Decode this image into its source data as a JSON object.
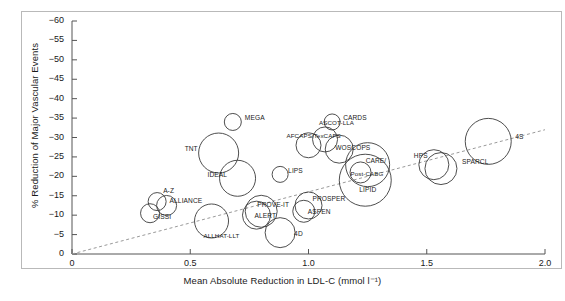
{
  "chart_data": {
    "type": "scatter",
    "title": "",
    "xlabel": "Mean Absolute Reduction in LDL-C (mmol l⁻¹)",
    "ylabel": "% Reduction of Major Vascular Events",
    "xlim": [
      0,
      2.0
    ],
    "ylim": [
      0,
      -60
    ],
    "xticks": [
      "0",
      "0.5",
      "1.0",
      "1.5",
      "2.0"
    ],
    "xtick_values": [
      0,
      0.5,
      1.0,
      1.5,
      2.0
    ],
    "yticks": [
      "0",
      "−5",
      "−10",
      "−15",
      "−20",
      "−25",
      "−30",
      "−35",
      "−40",
      "−45",
      "−50",
      "−55",
      "−60"
    ],
    "ytick_values": [
      0,
      -5,
      -10,
      -15,
      -20,
      -25,
      -30,
      -35,
      -40,
      -45,
      -50,
      -55,
      -60
    ],
    "grid": false,
    "legend": "none",
    "marker": "open-circle",
    "size_encodes": "trial size (bubble area)",
    "trendline": {
      "style": "dashed",
      "x0": 0.0,
      "y0": 0.0,
      "x1": 2.0,
      "y1": -32.0
    },
    "points": [
      {
        "label": "MEGA",
        "x": 0.68,
        "y": -34.0,
        "r": 8.5
      },
      {
        "label": "CARDS",
        "x": 1.1,
        "y": -34.0,
        "r": 8.0
      },
      {
        "label": "ASCOT-LLA",
        "x": 1.07,
        "y": -29.5,
        "r": 12.5
      },
      {
        "label": "AFCAPS/TexCAPS",
        "x": 1.0,
        "y": -28.0,
        "r": 12.5
      },
      {
        "label": "WOSCOPS",
        "x": 1.13,
        "y": -27.0,
        "r": 14.0
      },
      {
        "label": "CARE/",
        "x": 1.25,
        "y": -23.0,
        "r": 22.0
      },
      {
        "label": "Post-CABG",
        "x": 1.22,
        "y": -21.0,
        "r": 10.5
      },
      {
        "label": "LIPID",
        "x": 1.24,
        "y": -19.0,
        "r": 26.0
      },
      {
        "label": "TNT",
        "x": 0.62,
        "y": -26.0,
        "r": 20.0
      },
      {
        "label": "IDEAL",
        "x": 0.7,
        "y": -19.5,
        "r": 18.0
      },
      {
        "label": "LIPS",
        "x": 0.88,
        "y": -20.5,
        "r": 8.0
      },
      {
        "label": "HPS",
        "x": 1.53,
        "y": -23.0,
        "r": 15.0
      },
      {
        "label": "SPARCL",
        "x": 1.56,
        "y": -22.0,
        "r": 16.0
      },
      {
        "label": "4S",
        "x": 1.76,
        "y": -29.0,
        "r": 23.0
      },
      {
        "label": "A-Z",
        "x": 0.36,
        "y": -13.5,
        "r": 9.0
      },
      {
        "label": "ALLIANCE",
        "x": 0.4,
        "y": -12.5,
        "r": 10.0
      },
      {
        "label": "GISSI",
        "x": 0.33,
        "y": -10.5,
        "r": 9.5
      },
      {
        "label": "ALLHAT-LLT",
        "x": 0.59,
        "y": -8.5,
        "r": 17.0
      },
      {
        "label": "PROVE-IT",
        "x": 0.8,
        "y": -11.0,
        "r": 16.0
      },
      {
        "label": "ALERT",
        "x": 0.78,
        "y": -10.0,
        "r": 14.0
      },
      {
        "label": "PROSPER",
        "x": 1.0,
        "y": -12.5,
        "r": 13.5
      },
      {
        "label": "ASPEN",
        "x": 0.98,
        "y": -11.0,
        "r": 11.0
      },
      {
        "label": "4D",
        "x": 0.88,
        "y": -5.5,
        "r": 15.0
      }
    ]
  },
  "labels": {
    "mega": "MEGA",
    "cards": "CARDS",
    "ascot": "ASCOT-LLA",
    "afcaps": "AFCAPS/TexCAPS",
    "woscops": "WOSCOPS",
    "care": "CARE/",
    "postcabg": "Post-CABG",
    "lipid": "LIPID",
    "tnt": "TNT",
    "ideal": "IDEAL",
    "lips": "LIPS",
    "hps": "HPS",
    "sparcl": "SPARCL",
    "fours": "4S",
    "az": "A-Z",
    "alliance": "ALLIANCE",
    "gissi": "GISSI",
    "allhat": "ALLHAT-LLT",
    "proveit": "PROVE-IT",
    "alert": "ALERT",
    "prosper": "PROSPER",
    "aspen": "ASPEN",
    "fourd": "4D"
  },
  "colors": {
    "bubble_stroke": "#3a3a3a",
    "axis": "#555555",
    "trend": "#9a9a9a",
    "text": "#1a1a1a",
    "frame": "#b9b9b9",
    "background": "#ffffff"
  }
}
